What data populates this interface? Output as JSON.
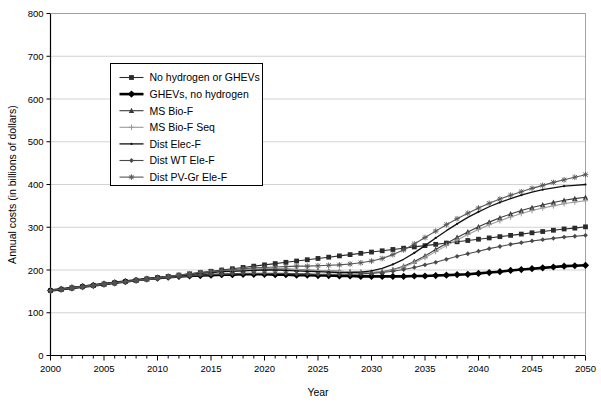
{
  "chart_data": {
    "type": "line",
    "title": "",
    "xlabel": "Year",
    "ylabel": "Annual costs (in billions of dollars)",
    "xlim": [
      2000,
      2050
    ],
    "ylim": [
      0,
      800
    ],
    "ytick_step": 100,
    "xtick_step": 5,
    "xminor_step": 1,
    "grid": "horizontal",
    "legend_position": "upper-left-inside",
    "yticks": [
      "0",
      "100",
      "200",
      "300",
      "400",
      "500",
      "600",
      "700",
      "800"
    ],
    "xticks": [
      "2000",
      "2005",
      "2010",
      "2015",
      "2020",
      "2025",
      "2030",
      "2035",
      "2040",
      "2045",
      "2050"
    ],
    "x": [
      2000,
      2001,
      2002,
      2003,
      2004,
      2005,
      2006,
      2007,
      2008,
      2009,
      2010,
      2011,
      2012,
      2013,
      2014,
      2015,
      2016,
      2017,
      2018,
      2019,
      2020,
      2021,
      2022,
      2023,
      2024,
      2025,
      2026,
      2027,
      2028,
      2029,
      2030,
      2031,
      2032,
      2033,
      2034,
      2035,
      2036,
      2037,
      2038,
      2039,
      2040,
      2041,
      2042,
      2043,
      2044,
      2045,
      2046,
      2047,
      2048,
      2049,
      2050
    ],
    "series": [
      {
        "name": "No hydrogen or GHEVs",
        "marker": "square",
        "color": "#2b2b2b",
        "width": 1.1,
        "values": [
          152,
          155,
          158,
          161,
          164,
          167,
          170,
          173,
          176,
          179,
          182,
          185,
          188,
          191,
          194,
          197,
          200,
          203,
          206,
          209,
          212,
          215,
          218,
          221,
          224,
          227,
          230,
          233,
          236,
          239,
          242,
          245,
          248,
          251,
          254,
          257,
          260,
          263,
          266,
          269,
          272,
          275,
          278,
          281,
          284,
          287,
          290,
          293,
          296,
          298,
          301
        ]
      },
      {
        "name": "GHEVs, no hydrogen",
        "marker": "diamond",
        "color": "#000000",
        "width": 2.6,
        "values": [
          152,
          155,
          158,
          161,
          164,
          167,
          170,
          173,
          176,
          179,
          181,
          183,
          185,
          186,
          187,
          188,
          189,
          189,
          190,
          190,
          190,
          189,
          189,
          188,
          188,
          187,
          187,
          186,
          186,
          185,
          185,
          185,
          185,
          185,
          186,
          186,
          187,
          188,
          189,
          190,
          192,
          194,
          196,
          199,
          201,
          203,
          205,
          207,
          209,
          210,
          211
        ]
      },
      {
        "name": "MS Bio-F",
        "marker": "triangle",
        "color": "#3a3a3a",
        "width": 1.1,
        "values": [
          152,
          155,
          158,
          161,
          164,
          167,
          170,
          173,
          176,
          179,
          182,
          185,
          188,
          190,
          193,
          195,
          197,
          199,
          200,
          201,
          202,
          202,
          202,
          201,
          200,
          199,
          198,
          197,
          196,
          195,
          194,
          196,
          201,
          209,
          220,
          233,
          248,
          262,
          276,
          289,
          301,
          312,
          322,
          331,
          339,
          346,
          352,
          358,
          363,
          367,
          370
        ]
      },
      {
        "name": "MS Bio-F Seq",
        "marker": "plus",
        "color": "#9a9a9a",
        "width": 1.1,
        "values": [
          152,
          155,
          158,
          161,
          164,
          167,
          170,
          173,
          176,
          179,
          182,
          185,
          188,
          190,
          193,
          195,
          197,
          199,
          200,
          201,
          202,
          202,
          202,
          201,
          200,
          199,
          198,
          197,
          196,
          195,
          194,
          196,
          200,
          207,
          217,
          229,
          243,
          257,
          270,
          283,
          295,
          306,
          315,
          324,
          332,
          339,
          345,
          350,
          355,
          359,
          362
        ]
      },
      {
        "name": "Dist Elec-F",
        "marker": "dot",
        "color": "#111111",
        "width": 1.3,
        "values": [
          152,
          155,
          158,
          161,
          164,
          167,
          170,
          173,
          176,
          179,
          182,
          185,
          187,
          190,
          192,
          194,
          196,
          197,
          198,
          199,
          200,
          200,
          199,
          198,
          197,
          196,
          195,
          194,
          194,
          195,
          198,
          204,
          213,
          225,
          240,
          257,
          275,
          292,
          308,
          323,
          336,
          348,
          358,
          367,
          375,
          382,
          388,
          392,
          396,
          398,
          400
        ]
      },
      {
        "name": "Dist WT Ele-F",
        "marker": "diamond-small",
        "color": "#4a4a4a",
        "width": 1.1,
        "values": [
          152,
          155,
          158,
          161,
          164,
          167,
          170,
          172,
          175,
          177,
          180,
          182,
          184,
          186,
          188,
          189,
          190,
          191,
          192,
          192,
          192,
          192,
          192,
          191,
          191,
          190,
          190,
          190,
          190,
          191,
          192,
          194,
          197,
          201,
          206,
          212,
          218,
          225,
          232,
          238,
          244,
          250,
          255,
          260,
          264,
          268,
          271,
          274,
          277,
          279,
          281
        ]
      },
      {
        "name": "Dist PV-Gr Ele-F",
        "marker": "star",
        "color": "#555555",
        "width": 1.1,
        "values": [
          152,
          155,
          158,
          161,
          164,
          167,
          170,
          173,
          176,
          179,
          182,
          185,
          188,
          191,
          194,
          196,
          199,
          201,
          203,
          205,
          206,
          207,
          208,
          209,
          209,
          210,
          211,
          212,
          214,
          217,
          221,
          227,
          236,
          247,
          261,
          276,
          291,
          306,
          320,
          333,
          345,
          356,
          366,
          375,
          383,
          391,
          398,
          405,
          411,
          417,
          423
        ]
      }
    ]
  }
}
